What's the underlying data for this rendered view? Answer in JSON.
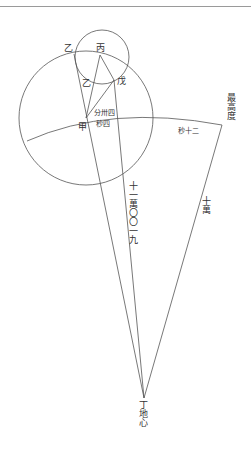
{
  "diagram": {
    "type": "geometric-astronomy-figure",
    "points": {
      "bing": "丙",
      "yi_outer": "乙",
      "yi_inner": "乙",
      "wu": "戊",
      "jia": "甲",
      "ding": "丁"
    },
    "labels": {
      "highest_altitude": "最高度",
      "ding_earth_center": "丁地心",
      "long_distance": "十一萬〇〇一九",
      "short_distance": "十萬",
      "angle_near_jia_top": "分卅四",
      "angle_near_jia_bottom": "秒四",
      "arc_angle": "秒十二"
    },
    "colors": {
      "line": "#555555",
      "text": "#333333",
      "background": "#ffffff"
    }
  }
}
